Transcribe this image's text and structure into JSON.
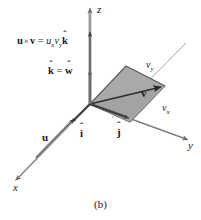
{
  "figure": {
    "caption": "(b)",
    "background_color": "#ffffff",
    "ink_color": "#1a1a1a",
    "axis_color": "#8c8c8c",
    "parallelogram_fill": "#a9a9a9",
    "parallelogram_stroke": "#4d4d4d",
    "axes": [
      {
        "name": "z",
        "label": "z",
        "direction": "up"
      },
      {
        "name": "y",
        "label": "y",
        "direction": "right-down"
      },
      {
        "name": "x",
        "label": "x",
        "direction": "left-down"
      }
    ],
    "formula": {
      "lhs_u": "u",
      "cross": "×",
      "lhs_v": "v",
      "equals": "=",
      "coef_u": "u",
      "coef_u_sub": "x",
      "coef_v": "v",
      "coef_v_sub": "y",
      "unit_vector": "k",
      "unit_vector_hat": "ˆ"
    },
    "unit_equation": {
      "left": "k",
      "left_hat": "ˆ",
      "equals": "=",
      "right": "w",
      "right_hat": "ˆ"
    },
    "labels": [
      {
        "name": "vector-u",
        "text": "u",
        "style": "bold"
      },
      {
        "name": "unit-i",
        "text": "i",
        "hat": "ˆ",
        "style": "bold-hat"
      },
      {
        "name": "unit-j",
        "text": "j",
        "hat": "ˆ",
        "style": "bold-hat"
      },
      {
        "name": "vector-v",
        "text": "v",
        "style": "bold"
      },
      {
        "name": "component-vx",
        "text": "v",
        "sub": "x",
        "style": "italic-sub"
      },
      {
        "name": "component-vy",
        "text": "v",
        "sub": "y",
        "style": "italic-sub"
      }
    ]
  }
}
